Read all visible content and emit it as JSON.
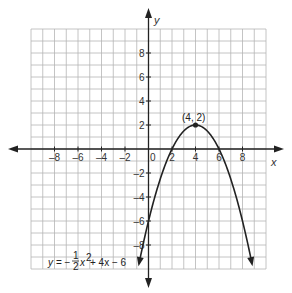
{
  "chart_data": {
    "type": "line",
    "title": "",
    "xlabel": "x",
    "ylabel": "y",
    "xlim": [
      -10,
      10
    ],
    "ylim": [
      -10,
      10
    ],
    "grid": true,
    "x_ticks": [
      -8,
      -6,
      -4,
      -2,
      0,
      2,
      4,
      6,
      8
    ],
    "y_ticks": [
      8,
      6,
      4,
      2,
      -2,
      -4,
      -6,
      -8
    ],
    "origin_label": "0",
    "series": [
      {
        "name": "y = -1/2 x^2 + 4x - 6",
        "function": "-0.5*x^2 + 4*x - 6",
        "x_range": [
          -0.8,
          8.8
        ],
        "arrows_both_ends": true,
        "color": "#222222"
      }
    ],
    "points": [
      {
        "x": 4,
        "y": 2,
        "label": "(4, 2)"
      }
    ],
    "annotations": [
      {
        "text": "y = -1/2 x^2 + 4x - 6",
        "position": "bottom-left"
      }
    ]
  },
  "labels": {
    "x_axis": "x",
    "y_axis": "y",
    "vertex": "(4, 2)",
    "origin": "0",
    "eq_y": "y",
    "eq_equals": "= −",
    "eq_num": "1",
    "eq_den": "2",
    "eq_x": "x",
    "eq_exp": "2",
    "eq_rest": " + 4x − 6"
  },
  "colors": {
    "grid": "#b5b5b5",
    "axis": "#222222",
    "curve": "#222222"
  }
}
